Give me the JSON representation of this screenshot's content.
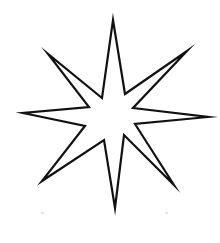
{
  "figure": {
    "stroke_color": "#111111",
    "fill_color": "#ffffff",
    "background": "#ffffff",
    "stroke_width": 2.2,
    "points": "113,20 125,94 187,51 133,108 208,117 135,124 174,185 124,135 115,208 104,140 42,181 85,126 23,113 89,107 48,54 102,98"
  },
  "artifacts": [
    {
      "x": 41,
      "y": 212
    },
    {
      "x": 165,
      "y": 212
    }
  ]
}
